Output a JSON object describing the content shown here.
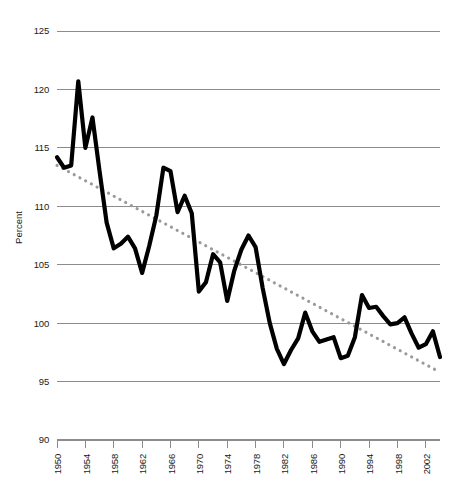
{
  "chart_data": {
    "type": "line",
    "title": "",
    "subtitle": "",
    "xlabel": "",
    "ylabel": "Percent",
    "ylim": [
      90,
      125
    ],
    "xlim": [
      1950,
      2004
    ],
    "grid": "horizontal",
    "legend": "none",
    "y_ticks": [
      125,
      120,
      115,
      110,
      105,
      100,
      95,
      90
    ],
    "x_ticks": [
      1950,
      1954,
      1958,
      1962,
      1966,
      1970,
      1974,
      1978,
      1982,
      1986,
      1990,
      1994,
      1998,
      2002
    ],
    "x_tick_labels": [
      "1950",
      "1954",
      "1958",
      "1962",
      "1966",
      "1970",
      "1974",
      "1978",
      "1982",
      "1986",
      "1990",
      "1994",
      "1998",
      "2002"
    ],
    "y_tick_labels": [
      "125",
      "120",
      "115",
      "110",
      "105",
      "100",
      "95",
      "90"
    ],
    "series": [
      {
        "name": "Percent",
        "style": "solid-thick-black",
        "color": "#000000",
        "x": [
          1950,
          1951,
          1952,
          1953,
          1954,
          1955,
          1956,
          1957,
          1958,
          1959,
          1960,
          1961,
          1962,
          1963,
          1964,
          1965,
          1966,
          1967,
          1968,
          1969,
          1970,
          1971,
          1972,
          1973,
          1974,
          1975,
          1976,
          1977,
          1978,
          1979,
          1980,
          1981,
          1982,
          1983,
          1984,
          1985,
          1986,
          1987,
          1988,
          1989,
          1990,
          1991,
          1992,
          1993,
          1994,
          1995,
          1996,
          1997,
          1998,
          1999,
          2000,
          2001,
          2002,
          2003,
          2004
        ],
        "values": [
          114.2,
          113.3,
          113.5,
          120.7,
          115.0,
          117.6,
          113.0,
          108.6,
          106.4,
          106.8,
          107.4,
          106.4,
          104.3,
          106.6,
          109.2,
          113.3,
          113.0,
          109.5,
          110.9,
          109.4,
          102.7,
          103.5,
          105.9,
          105.2,
          101.9,
          104.5,
          106.3,
          107.5,
          106.5,
          103.0,
          100.0,
          97.8,
          96.5,
          97.7,
          98.7,
          100.9,
          99.3,
          98.4,
          98.6,
          98.8,
          97.0,
          97.2,
          98.8,
          102.4,
          101.3,
          101.4,
          100.6,
          99.9,
          100.0,
          100.5,
          99.1,
          97.9,
          98.2,
          99.3,
          97.1
        ]
      },
      {
        "name": "Trend",
        "style": "dotted-gray",
        "color": "#9a9a9a",
        "x": [
          1950,
          2004
        ],
        "values": [
          113.5,
          95.8
        ]
      }
    ]
  },
  "axis": {
    "y_title": "Percent"
  }
}
